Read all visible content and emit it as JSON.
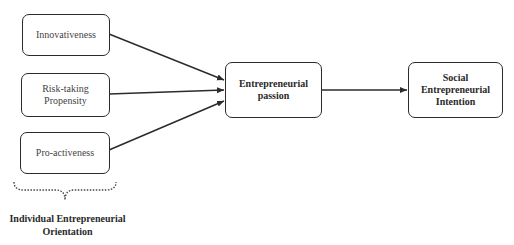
{
  "diagram": {
    "nodes": [
      {
        "id": "innovativeness",
        "label": "Innovativeness"
      },
      {
        "id": "risk_taking",
        "label_lines": [
          "Risk-taking",
          "Propensity"
        ]
      },
      {
        "id": "pro_activeness",
        "label": "Pro-activeness"
      },
      {
        "id": "entrepreneurial_passion",
        "label_lines": [
          "Entrepreneurial",
          "passion"
        ]
      },
      {
        "id": "social_entrepreneurial_intention",
        "label_lines": [
          "Social",
          "Entrepreneurial",
          "Intention"
        ]
      }
    ],
    "edges": [
      {
        "from": "innovativeness",
        "to": "entrepreneurial_passion"
      },
      {
        "from": "risk_taking",
        "to": "entrepreneurial_passion"
      },
      {
        "from": "pro_activeness",
        "to": "entrepreneurial_passion"
      },
      {
        "from": "entrepreneurial_passion",
        "to": "social_entrepreneurial_intention"
      }
    ],
    "group": {
      "members": [
        "innovativeness",
        "risk_taking",
        "pro_activeness"
      ],
      "label_lines": [
        "Individual Entrepreneurial",
        "Orientation"
      ]
    },
    "colors": {
      "stroke": "#2b2b2b",
      "background": "#ffffff"
    }
  }
}
